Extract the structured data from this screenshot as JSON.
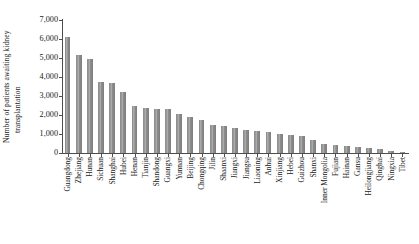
{
  "chart_data": {
    "type": "bar",
    "title": "",
    "xlabel": "",
    "ylabel": "Number of patients awaiting kidney transplantation",
    "ylabel_lines": [
      "Number of patients awaiting kidney",
      "transplantation"
    ],
    "ylim": [
      0,
      7000
    ],
    "ytick_labels": [
      "0",
      "1,000",
      "2,000",
      "3,000",
      "4,000",
      "5,000",
      "6,000",
      "7,000"
    ],
    "ytick_values": [
      0,
      1000,
      2000,
      3000,
      4000,
      5000,
      6000,
      7000
    ],
    "grid": false,
    "legend": null,
    "bar_color": "#8c8c8c",
    "axis_color": "#4d4d4d",
    "categories": [
      "Guangdong",
      "Zhejiang",
      "Hunan",
      "Sichuan",
      "Shanghai",
      "Hubei",
      "Henan",
      "Tianjin",
      "Shandong",
      "Guangxi",
      "Yunnan",
      "Beijing",
      "Chongqing",
      "Jilin",
      "Shaanxi",
      "Jiangxi",
      "Jiangsu",
      "Liaoning",
      "Anhui",
      "Xinjiang",
      "Hebei",
      "Guizhou",
      "Shanxi",
      "Inner Mongolia",
      "Fujian",
      "Hainan",
      "Gansu",
      "Heilongjiang",
      "Qinghai",
      "Ningxia",
      "Tibet"
    ],
    "values": [
      6100,
      5150,
      4950,
      3750,
      3700,
      3200,
      2500,
      2350,
      2300,
      2300,
      2050,
      1900,
      1750,
      1450,
      1400,
      1300,
      1200,
      1150,
      1100,
      1000,
      950,
      900,
      700,
      500,
      400,
      350,
      300,
      250,
      200,
      120,
      40
    ]
  }
}
